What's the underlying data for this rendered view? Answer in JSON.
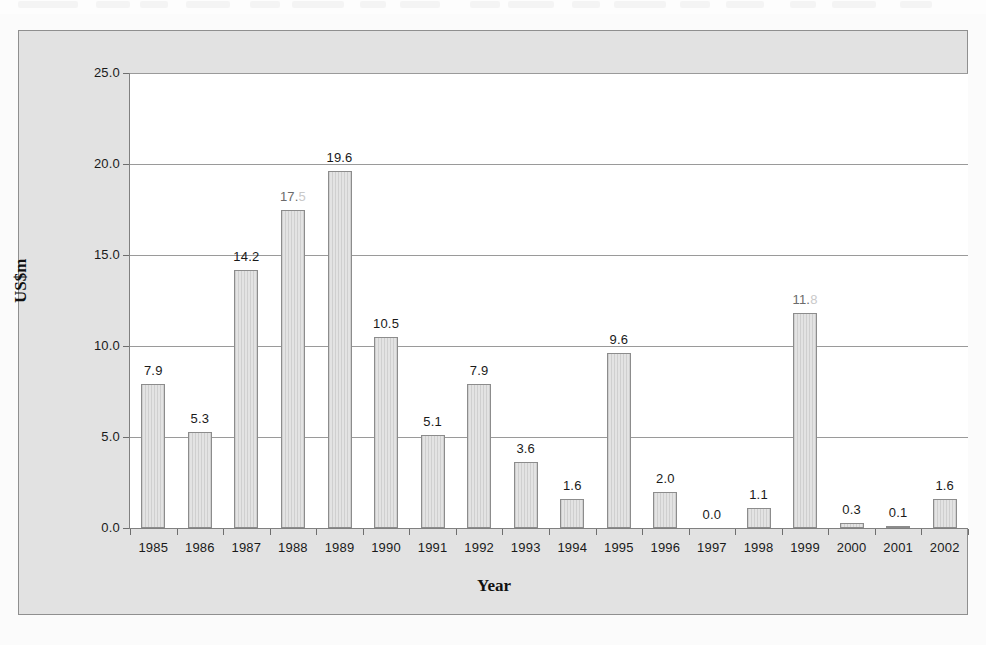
{
  "figure": {
    "y_axis_title": "US$m",
    "x_axis_title": "Year"
  },
  "chart_data": {
    "type": "bar",
    "title": "",
    "subtitle": "",
    "xlabel": "Year",
    "ylabel": "US$m",
    "categories": [
      "1985",
      "1986",
      "1987",
      "1988",
      "1989",
      "1990",
      "1991",
      "1992",
      "1993",
      "1994",
      "1995",
      "1996",
      "1997",
      "1998",
      "1999",
      "2000",
      "2001",
      "2002"
    ],
    "values": [
      7.9,
      5.3,
      14.2,
      17.5,
      19.6,
      10.5,
      5.1,
      7.9,
      3.6,
      1.6,
      9.6,
      2.0,
      0.0,
      1.1,
      11.8,
      0.3,
      0.1,
      1.6
    ],
    "data_labels": [
      "7.9",
      "5.3",
      "14.2",
      "17.5",
      "19.6",
      "10.5",
      "5.1",
      "7.9",
      "3.6",
      "1.6",
      "9.6",
      "2.0",
      "0.0",
      "1.1",
      "11.8",
      "0.3",
      "0.1",
      "1.6"
    ],
    "label_legibility": [
      "clear",
      "clear",
      "clear",
      "partially-faded",
      "clear",
      "clear",
      "clear",
      "clear",
      "clear",
      "clear",
      "clear",
      "clear",
      "clear",
      "clear",
      "partially-faded",
      "clear",
      "clear",
      "clear"
    ],
    "ylim": [
      0.0,
      25.0
    ],
    "ytick_labels": [
      "0.0",
      "5.0",
      "10.0",
      "15.0",
      "20.0",
      "25.0"
    ],
    "ytick_values": [
      0.0,
      5.0,
      10.0,
      15.0,
      20.0,
      25.0
    ],
    "grid": "horizontal",
    "legend": "none",
    "bar_fill": "#dcdcdc",
    "bar_border": "#8c8c8c",
    "plot_background": "#ffffff",
    "figure_background": "#e2e2e2"
  }
}
